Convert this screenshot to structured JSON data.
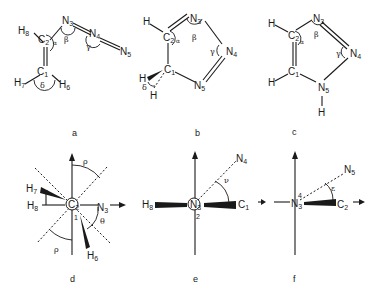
{
  "figure": {
    "panels": [
      {
        "id": "a",
        "caption": "a",
        "description": "vinyl azide open-chain structure",
        "atoms": [
          "H8",
          "C2",
          "N3",
          "N4",
          "N5",
          "C1",
          "H7",
          "H6"
        ],
        "angles": [
          "α",
          "β",
          "γ",
          "δ"
        ]
      },
      {
        "id": "b",
        "caption": "b",
        "description": "4,5-dihydro-1,2,3-triazole ring",
        "atoms": [
          "H",
          "C2",
          "N3",
          "N4",
          "N5",
          "C1",
          "H",
          "H"
        ],
        "angles": [
          "α",
          "β",
          "γ",
          "δ"
        ]
      },
      {
        "id": "c",
        "caption": "c",
        "description": "1H-1,2,3-triazole ring",
        "atoms": [
          "H",
          "C2",
          "N3",
          "N4",
          "N5",
          "C1",
          "H",
          "H"
        ],
        "angles": [
          "α",
          "β",
          "γ"
        ]
      },
      {
        "id": "d",
        "caption": "d",
        "description": "Newman projection along C2–C1",
        "atoms": [
          "H7",
          "H8",
          "C2",
          "1",
          "N3",
          "H6"
        ],
        "angles": [
          "ρ",
          "ρ",
          "φ",
          "θ"
        ]
      },
      {
        "id": "e",
        "caption": "e",
        "description": "Newman projection along N3–C2",
        "atoms": [
          "N4",
          "H8",
          "N3",
          "2",
          "C1"
        ],
        "angles": [
          "ν"
        ]
      },
      {
        "id": "f",
        "caption": "f",
        "description": "Newman projection along N4–N3",
        "atoms": [
          "N5",
          "4",
          "N3",
          "C2"
        ],
        "angles": [
          "ε"
        ]
      }
    ]
  },
  "labels": {
    "a": {
      "H8": "H",
      "H8s": "8",
      "C2": "C",
      "C2s": "2",
      "N3": "N",
      "N3s": "3",
      "N4": "N",
      "N4s": "4",
      "N5": "N",
      "N5s": "5",
      "C1": "C",
      "C1s": "1",
      "H7": "H",
      "H7s": "7",
      "H6": "H",
      "H6s": "6",
      "alpha": "α",
      "beta": "β",
      "gamma": "γ",
      "delta": "δ",
      "cap": "a"
    },
    "b": {
      "H": "H",
      "C2": "C",
      "C2s": "2",
      "N3": "N",
      "N3s": "3",
      "N4": "N",
      "N4s": "4",
      "N5": "N",
      "N5s": "5",
      "C1": "C",
      "C1s": "1",
      "alpha": "α",
      "beta": "β",
      "gamma": "γ",
      "delta": "δ",
      "cap": "b"
    },
    "c": {
      "H": "H",
      "C2": "C",
      "C2s": "2",
      "N3": "N",
      "N3s": "3",
      "N4": "N",
      "N4s": "4",
      "N5": "N",
      "N5s": "5",
      "C1": "C",
      "C1s": "1",
      "alpha": "α",
      "beta": "β",
      "gamma": "γ",
      "cap": "c"
    },
    "d": {
      "H7": "H",
      "H7s": "7",
      "H8": "H",
      "H8s": "8",
      "C2": "C",
      "C2s": "2",
      "one": "1",
      "N3": "N",
      "N3s": "3",
      "H6": "H",
      "H6s": "6",
      "rho": "ρ",
      "phi": "φ",
      "theta": "θ",
      "cap": "d"
    },
    "e": {
      "N4": "N",
      "N4s": "4",
      "H8": "H",
      "H8s": "8",
      "N3": "N",
      "N3s": "3",
      "two": "2",
      "C1": "C",
      "C1s": "1",
      "nu": "ν",
      "cap": "e"
    },
    "f": {
      "N5": "N",
      "N5s": "5",
      "N3": "N",
      "N3s": "3",
      "four": "4",
      "C2": "C",
      "C2s": "2",
      "eps": "ε",
      "cap": "f"
    }
  }
}
